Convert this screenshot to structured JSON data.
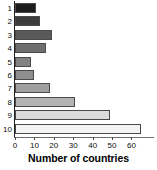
{
  "chart_data": {
    "type": "bar",
    "orientation": "horizontal",
    "title": "",
    "xlabel": "Number of countries",
    "ylabel": "",
    "categories": [
      "1",
      "2",
      "3",
      "4",
      "5",
      "6",
      "7",
      "8",
      "9",
      "10"
    ],
    "values": [
      11,
      13,
      19,
      16,
      8,
      10,
      18,
      31,
      49,
      65
    ],
    "xlim": [
      0,
      68
    ],
    "ylim": null,
    "xticks": [
      0,
      10,
      20,
      30,
      40,
      50,
      60
    ],
    "xtick_labels": [
      "0",
      "10",
      "20",
      "30",
      "40",
      "50",
      "60"
    ],
    "grid": false,
    "legend": null,
    "bar_colors": [
      "#1c1c1c",
      "#3d3d3d",
      "#5a5a5a",
      "#6e6e6e",
      "#828282",
      "#8e8e8e",
      "#a0a0a0",
      "#b4b4b4",
      "#dcdcdc",
      "#f4f4f4"
    ],
    "bar_edge_color": "#4a4a4a",
    "axis_color": "#4a4a4a",
    "background": "#ffffff"
  }
}
